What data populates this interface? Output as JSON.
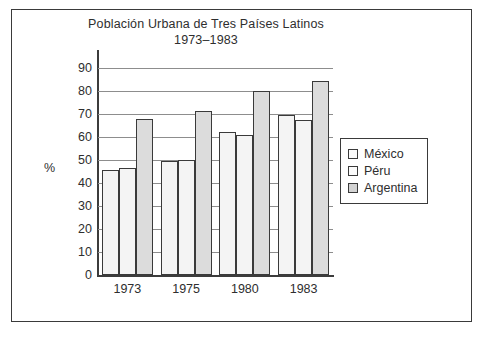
{
  "chart_data": {
    "type": "bar",
    "title": "Población Urbana de Tres Países Latinos",
    "subtitle": "1973–1983",
    "xlabel": "",
    "ylabel": "%",
    "categories": [
      "1973",
      "1975",
      "1980",
      "1983"
    ],
    "series": [
      {
        "name": "México",
        "values": [
          45.5,
          49.5,
          62.0,
          69.5
        ],
        "color": "#f4f4f4"
      },
      {
        "name": "Péru",
        "values": [
          46.5,
          50.0,
          61.0,
          67.5
        ],
        "color": "#f4f4f4"
      },
      {
        "name": "Argentina",
        "values": [
          68.0,
          71.5,
          80.0,
          84.5
        ],
        "color": "#dcdcdc"
      }
    ],
    "ylim": [
      0,
      90
    ],
    "yticks": [
      0,
      10,
      20,
      30,
      40,
      50,
      60,
      70,
      80,
      90
    ],
    "grid": true,
    "legend_position": "right"
  },
  "legend": {
    "items": [
      {
        "label": "México"
      },
      {
        "label": "Péru"
      },
      {
        "label": "Argentina"
      }
    ]
  },
  "colors": {
    "axis": "#3c3c3c",
    "grid": "#8d8d8d",
    "frame": "#3a3a3a",
    "text": "#2e2e2e"
  }
}
